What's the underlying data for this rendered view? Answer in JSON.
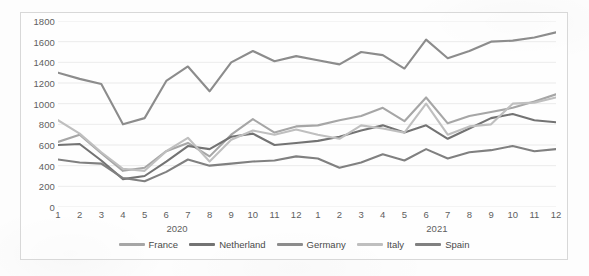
{
  "chart_data": {
    "type": "line",
    "title": "",
    "subtitle": "",
    "xlabel": "",
    "ylabel": "",
    "grid": true,
    "grid_axis": "y",
    "legend_position": "bottom",
    "ylim": [
      0,
      1800
    ],
    "ytick_step": 200,
    "ytick_labels": [
      "1800",
      "1600",
      "1400",
      "1200",
      "1000",
      "800",
      "600",
      "400",
      "200",
      "0"
    ],
    "ytick_values": [
      1800,
      1600,
      1400,
      1200,
      1000,
      800,
      600,
      400,
      200,
      0
    ],
    "x": [
      "1",
      "2",
      "3",
      "4",
      "5",
      "6",
      "7",
      "8",
      "9",
      "10",
      "11",
      "12",
      "1",
      "2",
      "3",
      "4",
      "5",
      "6",
      "7",
      "8",
      "9",
      "10",
      "11",
      "12"
    ],
    "xtick_labels": [
      "1",
      "2",
      "3",
      "4",
      "5",
      "6",
      "7",
      "8",
      "9",
      "10",
      "11",
      "12",
      "1",
      "2",
      "3",
      "4",
      "5",
      "6",
      "7",
      "8",
      "9",
      "10",
      "11",
      "12"
    ],
    "x_groups": [
      {
        "label": "2020",
        "start_index": 0,
        "end_index": 11
      },
      {
        "label": "2021",
        "start_index": 12,
        "end_index": 23
      }
    ],
    "series": [
      {
        "name": "France",
        "color": "#a6a6a6",
        "values": [
          630,
          700,
          520,
          350,
          380,
          540,
          620,
          490,
          700,
          850,
          720,
          780,
          790,
          840,
          880,
          960,
          830,
          1060,
          810,
          880,
          920,
          960,
          1020,
          1090
        ]
      },
      {
        "name": "Netherland",
        "color": "#737373",
        "values": [
          600,
          610,
          450,
          270,
          300,
          440,
          590,
          560,
          680,
          710,
          600,
          620,
          640,
          680,
          740,
          790,
          720,
          790,
          660,
          760,
          860,
          900,
          840,
          820
        ]
      },
      {
        "name": "Germany",
        "color": "#8c8c8c",
        "values": [
          1300,
          1240,
          1190,
          800,
          860,
          1220,
          1360,
          1120,
          1400,
          1510,
          1410,
          1460,
          1420,
          1380,
          1500,
          1470,
          1340,
          1620,
          1440,
          1510,
          1600,
          1610,
          1640,
          1690
        ]
      },
      {
        "name": "Italy",
        "color": "#bfbfbf",
        "values": [
          840,
          710,
          530,
          370,
          350,
          540,
          670,
          440,
          650,
          740,
          700,
          750,
          700,
          660,
          790,
          760,
          720,
          1000,
          700,
          780,
          800,
          1000,
          1010,
          1060
        ]
      },
      {
        "name": "Spain",
        "color": "#808080",
        "values": [
          460,
          430,
          420,
          280,
          250,
          340,
          460,
          400,
          420,
          440,
          450,
          490,
          470,
          380,
          430,
          510,
          450,
          560,
          470,
          530,
          550,
          590,
          540,
          560
        ]
      }
    ],
    "legend": [
      {
        "label": "France",
        "color": "#a6a6a6"
      },
      {
        "label": "Netherland",
        "color": "#737373"
      },
      {
        "label": "Germany",
        "color": "#8c8c8c"
      },
      {
        "label": "Italy",
        "color": "#bfbfbf"
      },
      {
        "label": "Spain",
        "color": "#808080"
      }
    ]
  },
  "colors": {
    "gridline": "#e6e6e6",
    "axis_text": "#5e5e5e",
    "legend_text": "#4a4a4a",
    "frame_border": "#d8d8d8",
    "page_background": "#fdfdfd"
  }
}
